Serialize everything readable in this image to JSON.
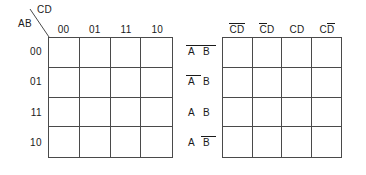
{
  "figure": {
    "type": "karnaugh-map-pair",
    "background_color": "#ffffff",
    "line_color": "#4a4a4a",
    "text_color": "#1a1a1a"
  },
  "left_map": {
    "name": "binary-labelled-kmap",
    "corner": {
      "column_variable_label": "CD",
      "row_variable_label": "AB"
    },
    "column_headers": [
      "00",
      "01",
      "11",
      "10"
    ],
    "row_headers": [
      "00",
      "01",
      "11",
      "10"
    ],
    "cells": [
      [
        "",
        "",
        "",
        ""
      ],
      [
        "",
        "",
        "",
        ""
      ],
      [
        "",
        "",
        "",
        ""
      ],
      [
        "",
        "",
        "",
        ""
      ]
    ]
  },
  "right_map": {
    "name": "literal-labelled-kmap",
    "column_headers": [
      {
        "text": "CD",
        "bars": [
          true,
          true
        ]
      },
      {
        "text": "CD",
        "bars": [
          true,
          false
        ]
      },
      {
        "text": "CD",
        "bars": [
          false,
          false
        ]
      },
      {
        "text": "CD",
        "bars": [
          false,
          true
        ]
      }
    ],
    "row_headers": [
      {
        "text": "AB",
        "bars": [
          true,
          true
        ]
      },
      {
        "text": "AB",
        "bars": [
          true,
          false
        ]
      },
      {
        "text": "AB",
        "bars": [
          false,
          false
        ]
      },
      {
        "text": "AB",
        "bars": [
          false,
          true
        ]
      }
    ],
    "cells": [
      [
        "",
        "",
        "",
        ""
      ],
      [
        "",
        "",
        "",
        ""
      ],
      [
        "",
        "",
        "",
        ""
      ],
      [
        "",
        "",
        "",
        ""
      ]
    ]
  }
}
